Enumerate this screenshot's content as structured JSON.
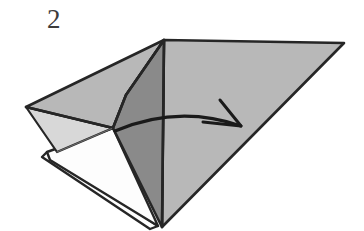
{
  "figure": {
    "type": "origami-fold-diagram",
    "step_number": "2",
    "background_color": "#ffffff",
    "stroke_color": "#262626",
    "colors": {
      "paper_light": "#b8b8b8",
      "paper_mid": "#b0b0b0",
      "paper_dark": "#8a8a8a",
      "paper_shadow": "#9a9a9a",
      "paper_white": "#fdfdfd",
      "paper_pale": "#d8d8d8",
      "outline": "#262626",
      "crease": "#555555",
      "arrow": "#1a1a1a"
    },
    "faces": [
      {
        "name": "right-large-flap",
        "fill": "paper_light",
        "points": "164,40 344,43 162,227"
      },
      {
        "name": "center-dark-gusset",
        "fill": "paper_dark",
        "points": "164,40 162,227 113,128 126,95"
      },
      {
        "name": "upper-left-panel",
        "fill": "paper_light",
        "points": "164,40 126,95 113,128 26,107"
      },
      {
        "name": "left-lower-pale-wedge",
        "fill": "paper_pale",
        "points": "26,107 113,128 57,152"
      },
      {
        "name": "inner-white-pocket",
        "fill": "paper_white",
        "points": "47,152 113,128 158,226 50,160"
      },
      {
        "name": "bottom-white-sliver",
        "fill": "paper_white",
        "points": "47,152 158,226 150,229 42,157"
      }
    ],
    "creases": [
      {
        "name": "apex-vertical-crease",
        "path": "164,40 162,227"
      },
      {
        "name": "left-fold-crease",
        "path": "26,107 113,128"
      },
      {
        "name": "inner-pocket-crease",
        "path": "57,152 113,128"
      }
    ],
    "arrow": {
      "name": "fold-direction-arrow",
      "description": "curved arrow pointing right, indicating the flap folds to the right",
      "start": "115,131",
      "end": "241,126",
      "control": "178,104",
      "head_barb_upper": "220,100",
      "head_barb_lower": "203,122",
      "stroke_width": 3
    }
  }
}
